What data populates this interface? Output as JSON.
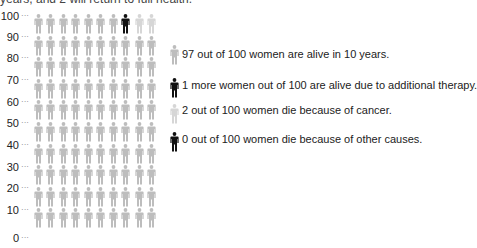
{
  "header": {
    "clipped_text": "years, and 2 will return to full health."
  },
  "chart_data": {
    "type": "pictograph",
    "title": "",
    "xlabel": "",
    "ylabel": "",
    "ylim": [
      0,
      100
    ],
    "y_ticks": [
      "100",
      "90",
      "80",
      "70",
      "60",
      "50",
      "40",
      "30",
      "20",
      "10",
      "0"
    ],
    "grid": {
      "rows": 10,
      "cols": 10
    },
    "colors": {
      "alive": "#bdbdbd",
      "therapy": "#111111",
      "cancer": "#d6d6d6",
      "other": "#111111"
    },
    "categories": [
      "alive in 10 years",
      "alive due to additional therapy",
      "die because of cancer",
      "die because of other causes"
    ],
    "values": [
      97,
      1,
      2,
      0
    ],
    "top_row_layout": [
      "alive",
      "alive",
      "alive",
      "alive",
      "alive",
      "alive",
      "alive",
      "therapy",
      "cancer",
      "cancer"
    ],
    "legend": [
      {
        "key": "alive",
        "label": "97 out of 100 women are alive in 10 years."
      },
      {
        "key": "therapy",
        "label": "1 more women out of 100 are alive due to additional therapy."
      },
      {
        "key": "cancer",
        "label": "2 out of 100 women die because of cancer."
      },
      {
        "key": "other",
        "label": "0 out of 100 women die because of other causes."
      }
    ]
  }
}
